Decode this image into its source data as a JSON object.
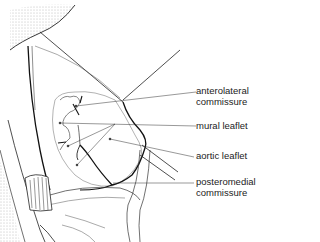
{
  "figure": {
    "labels": [
      {
        "id": "anterolateral",
        "line1": "anterolateral",
        "line2": "commissure"
      },
      {
        "id": "mural",
        "line1": "mural leaflet"
      },
      {
        "id": "aortic",
        "line1": "aortic leaflet"
      },
      {
        "id": "posteromedial",
        "line1": "posteromedial",
        "line2": "commissure"
      }
    ]
  }
}
